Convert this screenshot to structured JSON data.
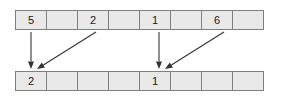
{
  "figure": {
    "title": ""
  },
  "arrays": {
    "top": {
      "name": "source-array",
      "cell_count": 8,
      "cells": [
        {
          "index": 0,
          "value": "5"
        },
        {
          "index": 1,
          "value": ""
        },
        {
          "index": 2,
          "value": "2"
        },
        {
          "index": 3,
          "value": ""
        },
        {
          "index": 4,
          "value": "1"
        },
        {
          "index": 5,
          "value": ""
        },
        {
          "index": 6,
          "value": "6"
        },
        {
          "index": 7,
          "value": ""
        }
      ]
    },
    "bottom": {
      "name": "destination-array",
      "cell_count": 8,
      "cells": [
        {
          "index": 0,
          "value": "2"
        },
        {
          "index": 1,
          "value": ""
        },
        {
          "index": 2,
          "value": ""
        },
        {
          "index": 3,
          "value": ""
        },
        {
          "index": 4,
          "value": "1"
        },
        {
          "index": 5,
          "value": ""
        },
        {
          "index": 6,
          "value": ""
        },
        {
          "index": 7,
          "value": ""
        }
      ]
    }
  },
  "arrows": [
    {
      "name": "arrow-cell0-vertical",
      "from_x": 31,
      "from_y": 32,
      "to_x": 31,
      "to_y": 69,
      "kind": "vertical"
    },
    {
      "name": "arrow-cell2-diagonal",
      "from_x": 96,
      "from_y": 32,
      "to_x": 37,
      "to_y": 69,
      "kind": "diagonal"
    },
    {
      "name": "arrow-cell4-vertical",
      "from_x": 159,
      "from_y": 32,
      "to_x": 159,
      "to_y": 69,
      "kind": "vertical"
    },
    {
      "name": "arrow-cell6-diagonal",
      "from_x": 224,
      "from_y": 32,
      "to_x": 165,
      "to_y": 69,
      "kind": "diagonal"
    }
  ],
  "colors": {
    "background": "#ffffff",
    "cell_fill": "#e9e9e9",
    "cell_border": "#7f7f7f",
    "text": "#1a1a1a",
    "arrow": "#333333"
  }
}
